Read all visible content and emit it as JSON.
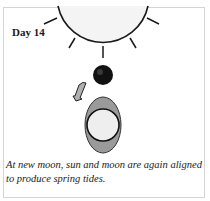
{
  "diagram": {
    "label": "Day 14",
    "caption": "At new moon, sun and moon are again aligned to produce spring tides.",
    "elements": {
      "sun": "sun-icon",
      "moon": "new-moon-icon",
      "earth": "earth-icon",
      "tidal_bulge": "tidal-bulge",
      "rotation_arrow": "curved-arrow-icon"
    },
    "colors": {
      "sun_fill": "#f4f4f4",
      "outline": "#1a1a1a",
      "moon_fill": "#111111",
      "bulge_fill": "#9a9a9a",
      "earth_fill": "#eeeeee",
      "arrow_fill": "#b0b0b0"
    }
  }
}
